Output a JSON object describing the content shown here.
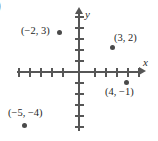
{
  "artifact": {
    "stray_paren": ")"
  },
  "axes": {
    "x_label": "x",
    "y_label": "y"
  },
  "chart_data": {
    "type": "scatter",
    "title": "",
    "xlabel": "x",
    "ylabel": "y",
    "xlim": [
      -6,
      6
    ],
    "ylim": [
      -5,
      5
    ],
    "grid": false,
    "legend": null,
    "x_ticks": [
      -5,
      -4,
      -3,
      -2,
      -1,
      1,
      2,
      3,
      4,
      5
    ],
    "y_ticks": [
      -5,
      -4,
      -3,
      -2,
      -1,
      1,
      2,
      3,
      4,
      5
    ],
    "tick_labels_shown": false,
    "points": [
      {
        "label": "(−2, 3)",
        "x": -2,
        "y": 3,
        "label_position": "left",
        "dot_px": {
          "left": 57,
          "top": 30
        },
        "label_px": {
          "left": 21,
          "top": 26
        }
      },
      {
        "label": "(3, 2)",
        "x": 3,
        "y": 2,
        "label_position": "upper-right",
        "dot_px": {
          "left": 110,
          "top": 45
        },
        "label_px": {
          "left": 114,
          "top": 33
        }
      },
      {
        "label": "(4, −1)",
        "x": 4,
        "y": -1,
        "label_position": "below",
        "dot_px": {
          "left": 124,
          "top": 80
        },
        "label_px": {
          "left": 105,
          "top": 87
        }
      },
      {
        "label": "(−5, −4)",
        "x": -5,
        "y": -4,
        "label_position": "above",
        "dot_px": {
          "left": 22,
          "top": 123
        },
        "label_px": {
          "left": 8,
          "top": 108
        }
      }
    ],
    "tick_geometry": {
      "origin_px": {
        "left": 79,
        "top": 72
      },
      "spacing_px": 11,
      "x_tick_offsets": [
        -60,
        -49,
        -38,
        -27,
        -16,
        16,
        27,
        38,
        49,
        60
      ],
      "y_tick_offsets": [
        -55,
        -44,
        -33,
        -22,
        -11,
        11,
        22,
        33,
        44,
        55
      ]
    }
  }
}
